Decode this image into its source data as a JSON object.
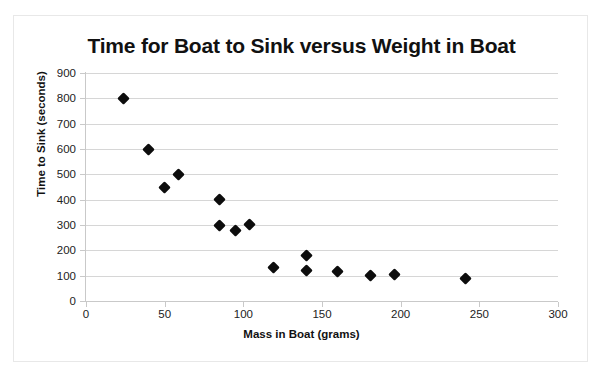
{
  "chart_data": {
    "type": "scatter",
    "title": "Time for Boat to Sink versus Weight in Boat",
    "xlabel": "Mass in Boat (grams)",
    "ylabel": "Time to Sink (seconds)",
    "xlim": [
      0,
      300
    ],
    "ylim": [
      0,
      900
    ],
    "xticks": [
      0,
      50,
      100,
      150,
      200,
      250,
      300
    ],
    "yticks": [
      0,
      100,
      200,
      300,
      400,
      500,
      600,
      700,
      800,
      900
    ],
    "grid": "horizontal",
    "legend": "none",
    "marker": "diamond",
    "marker_color": "#0d0d0d",
    "series": [
      {
        "name": "Time to Sink",
        "points": [
          {
            "x": 24,
            "y": 800
          },
          {
            "x": 40,
            "y": 600
          },
          {
            "x": 50,
            "y": 450
          },
          {
            "x": 59,
            "y": 500
          },
          {
            "x": 85,
            "y": 400
          },
          {
            "x": 85,
            "y": 300
          },
          {
            "x": 95,
            "y": 277
          },
          {
            "x": 104,
            "y": 303
          },
          {
            "x": 119,
            "y": 133
          },
          {
            "x": 140,
            "y": 181
          },
          {
            "x": 140,
            "y": 122
          },
          {
            "x": 160,
            "y": 115
          },
          {
            "x": 181,
            "y": 100
          },
          {
            "x": 196,
            "y": 104
          },
          {
            "x": 241,
            "y": 87
          }
        ]
      }
    ]
  },
  "axes": {
    "y_tick_labels": [
      "900",
      "800",
      "700",
      "600",
      "500",
      "400",
      "300",
      "200",
      "100",
      "0"
    ],
    "x_tick_labels": [
      "0",
      "50",
      "100",
      "150",
      "200",
      "250",
      "300"
    ]
  },
  "colors": {
    "marker": "#0d0d0d",
    "gridline": "#d6d6d6",
    "axis": "#c9c9c9",
    "text": "#111111",
    "frame": "#e8e8e8",
    "background": "#ffffff"
  }
}
